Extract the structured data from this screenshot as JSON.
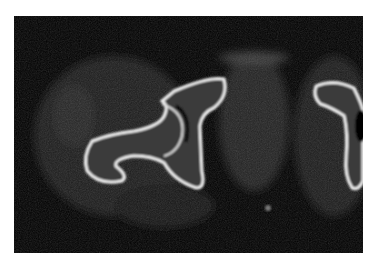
{
  "image": {
    "kind": "axial CT slice of pelvis/hip",
    "background_color": "#ffffff",
    "frame_color": "#000000",
    "bone_color": "#f2f2f2",
    "soft_tissue_color": "#262626"
  }
}
